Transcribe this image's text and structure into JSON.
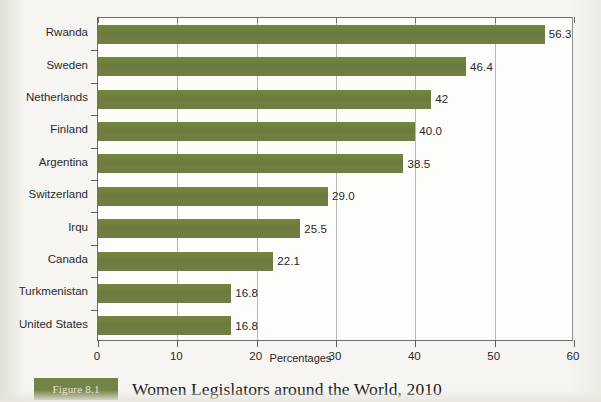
{
  "figure": {
    "badge_label": "Figure 8.1",
    "caption": "Women Legislators around the World, 2010"
  },
  "chart_data": {
    "type": "bar",
    "orientation": "horizontal",
    "title": "Women Legislators around the World, 2010",
    "xlabel": "Percentages",
    "ylabel": "",
    "xlim": [
      0,
      60
    ],
    "xticks": [
      0,
      10,
      20,
      30,
      40,
      50,
      60
    ],
    "xtick_labels": [
      "0",
      "10",
      "20",
      "30",
      "40",
      "50",
      "60"
    ],
    "grid": true,
    "grid_axis": "x",
    "legend": false,
    "bar_color": "#6e7d3f",
    "plot_background": "#fdfdfb",
    "categories": [
      "Rwanda",
      "Sweden",
      "Netherlands",
      "Finland",
      "Argentina",
      "Switzerland",
      "Irqu",
      "Canada",
      "Turkmenistan",
      "United States"
    ],
    "values": [
      56.3,
      46.4,
      42,
      40.0,
      38.5,
      29.0,
      25.5,
      22.1,
      16.8,
      16.8
    ],
    "data_labels": [
      "56.3",
      "46.4",
      "42",
      "40.0",
      "38.5",
      "29.0",
      "25.5",
      "22.1",
      "16.8",
      "16.8"
    ]
  }
}
